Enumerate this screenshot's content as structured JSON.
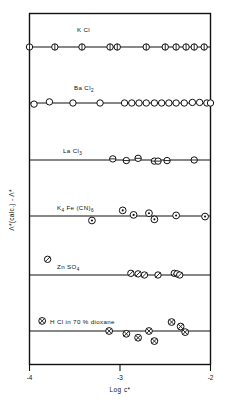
{
  "chart_data": {
    "type": "scatter",
    "title": "",
    "xlabel": "Log c*",
    "ylabel": "Λ*(calc.) - Λ*",
    "xlim": [
      -4.0,
      -2.0
    ],
    "xticks": [
      -4,
      -3,
      -2
    ],
    "xticklabels": [
      "-4",
      "-3",
      "-2"
    ],
    "grid": false,
    "legend_position": "inline-annotations",
    "note": "Six stacked panels, each with its own zero baseline; deviation of calculated from observed equivalent conductance plotted against log concentration.",
    "series": [
      {
        "name": "KCl",
        "label": "K Cl",
        "label_x": -3.22,
        "marker": "circle-vertical-bar",
        "baseline_index": 0,
        "points": [
          {
            "x": -4.0,
            "y": 0.0
          },
          {
            "x": -3.72,
            "y": 0.0
          },
          {
            "x": -3.42,
            "y": 0.0
          },
          {
            "x": -3.11,
            "y": 0.0
          },
          {
            "x": -3.03,
            "y": 0.0
          },
          {
            "x": -2.71,
            "y": 0.0
          },
          {
            "x": -2.5,
            "y": 0.0
          },
          {
            "x": -2.38,
            "y": 0.0
          },
          {
            "x": -2.27,
            "y": 0.0
          },
          {
            "x": -2.18,
            "y": 0.0
          },
          {
            "x": -2.07,
            "y": 0.0
          }
        ]
      },
      {
        "name": "BaCl2",
        "label": "Ba Cl",
        "label_sub": "2",
        "label_x": -3.25,
        "marker": "circle-open",
        "baseline_index": 1,
        "points": [
          {
            "x": -3.95,
            "y": -0.02
          },
          {
            "x": -3.78,
            "y": 0.02
          },
          {
            "x": -3.52,
            "y": 0.0
          },
          {
            "x": -3.22,
            "y": 0.0
          },
          {
            "x": -2.95,
            "y": 0.0
          },
          {
            "x": -2.87,
            "y": 0.0
          },
          {
            "x": -2.79,
            "y": 0.0
          },
          {
            "x": -2.71,
            "y": 0.0
          },
          {
            "x": -2.62,
            "y": 0.0
          },
          {
            "x": -2.54,
            "y": 0.0
          },
          {
            "x": -2.46,
            "y": 0.0
          },
          {
            "x": -2.38,
            "y": 0.0
          },
          {
            "x": -2.29,
            "y": 0.0
          },
          {
            "x": -2.2,
            "y": 0.01
          },
          {
            "x": -2.12,
            "y": 0.01
          },
          {
            "x": -2.04,
            "y": 0.0
          },
          {
            "x": -2.0,
            "y": 0.0
          }
        ]
      },
      {
        "name": "LaCl3",
        "label": "La Cl",
        "label_sub": "3",
        "label_x": -3.28,
        "marker": "circle-horizontal-bar",
        "baseline_index": 2,
        "points": [
          {
            "x": -3.08,
            "y": 0.02
          },
          {
            "x": -2.93,
            "y": -0.01
          },
          {
            "x": -2.8,
            "y": 0.03
          },
          {
            "x": -2.62,
            "y": -0.02
          },
          {
            "x": -2.58,
            "y": -0.02
          },
          {
            "x": -2.48,
            "y": -0.01
          },
          {
            "x": -2.18,
            "y": 0.0
          }
        ]
      },
      {
        "name": "K4Fe(CN)6",
        "label": "K₄ Fe (CN)₆",
        "label_x": -3.3,
        "marker": "circle-dot",
        "baseline_index": 3,
        "points": [
          {
            "x": -2.97,
            "y": 0.1
          },
          {
            "x": -3.31,
            "y": -0.08
          },
          {
            "x": -2.85,
            "y": 0.02
          },
          {
            "x": -2.68,
            "y": 0.05
          },
          {
            "x": -2.62,
            "y": -0.06
          },
          {
            "x": -2.38,
            "y": 0.01
          },
          {
            "x": -2.06,
            "y": -0.01
          }
        ]
      },
      {
        "name": "ZnSO4",
        "label": "Zn SO₄",
        "label_x": -3.3,
        "marker": "circle-slash",
        "baseline_index": 4,
        "points": [
          {
            "x": -3.8,
            "y": 0.28
          },
          {
            "x": -2.88,
            "y": 0.03
          },
          {
            "x": -2.8,
            "y": 0.02
          },
          {
            "x": -2.73,
            "y": 0.0
          },
          {
            "x": -2.58,
            "y": 0.0
          },
          {
            "x": -2.4,
            "y": 0.03
          },
          {
            "x": -2.37,
            "y": 0.02
          },
          {
            "x": -2.34,
            "y": 0.0
          }
        ]
      },
      {
        "name": "HCl in 70% dioxane",
        "label": "H Cl in 70 % dioxane",
        "label_x": -3.38,
        "marker": "circle-cross",
        "baseline_index": 5,
        "points": [
          {
            "x": -3.86,
            "y": 0.18
          },
          {
            "x": -3.12,
            "y": 0.0
          },
          {
            "x": -2.93,
            "y": -0.05
          },
          {
            "x": -2.8,
            "y": -0.12
          },
          {
            "x": -2.68,
            "y": 0.0
          },
          {
            "x": -2.62,
            "y": -0.18
          },
          {
            "x": -2.43,
            "y": 0.16
          },
          {
            "x": -2.33,
            "y": 0.08
          },
          {
            "x": -2.28,
            "y": -0.02
          }
        ]
      }
    ]
  },
  "axis": {
    "x_tick_minus4": "-4",
    "x_tick_minus3": "-3",
    "x_tick_minus2": "-2",
    "x_title": "Log c*",
    "y_title": "Λ*(calc.) - Λ*"
  },
  "labels": {
    "kcl": "K Cl",
    "bacl2_main": "Ba Cl",
    "bacl2_sub": "2",
    "lacl3_main": "La Cl",
    "lacl3_sub": "3",
    "kfecn_main": "K",
    "kfecn_sub1": "4",
    "kfecn_mid": " Fe (CN)",
    "kfecn_sub2": "6",
    "znso4_main": "Zn SO",
    "znso4_sub": "4",
    "hcl": "H Cl in 70 % dioxane"
  }
}
